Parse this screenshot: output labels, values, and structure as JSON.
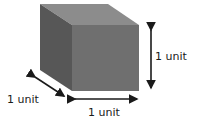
{
  "diagram": {
    "labels": {
      "height": "1 unit",
      "depth": "1 unit",
      "width": "1 unit"
    },
    "colors": {
      "top_face": "#8c8c8c",
      "front_face": "#6f6f6f",
      "side_face": "#575757",
      "arrow": "#1a1a1a"
    }
  }
}
